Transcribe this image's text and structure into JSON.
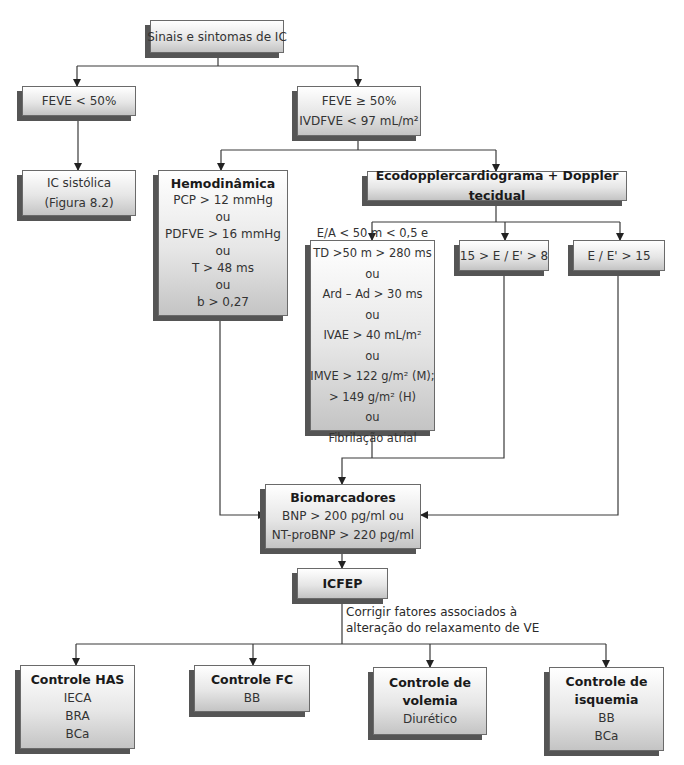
{
  "diagram": {
    "start": {
      "label": "Sinais e sintomas de IC"
    },
    "feve_low": {
      "label": "FEVE < 50%"
    },
    "feve_high": {
      "lines": [
        "FEVE ≥ 50%",
        "IVDFVE < 97 mL/m²"
      ]
    },
    "ic_sistolica": {
      "lines": [
        "IC sistólica",
        "(Figura 8.2)"
      ]
    },
    "hemodinamica": {
      "title": "Hemodinâmica",
      "lines": [
        "PCP > 12 mmHg",
        "ou",
        "PDFVE > 16 mmHg",
        "ou",
        "T > 48 ms",
        "ou",
        "b > 0,27"
      ]
    },
    "ecodoppler": {
      "title": "Ecodopplercardiograma + Doppler tecidual"
    },
    "eco_criteria": {
      "lines": [
        "E/A < 50 m < 0,5 e",
        "TD >50 m > 280 ms",
        "ou",
        "Ard – Ad > 30 ms",
        "ou",
        "IVAE > 40 mL/m²",
        "ou",
        "IMVE > 122 g/m² (M);",
        "> 149 g/m² (H)",
        "ou",
        "Fibrilação atrial"
      ]
    },
    "ratio_mid": {
      "label": "15 > E / E' > 8"
    },
    "ratio_high": {
      "label": "E / E' > 15"
    },
    "biomarcadores": {
      "title": "Biomarcadores",
      "lines": [
        "BNP > 200 pg/ml ou",
        "NT-proBNP > 220 pg/ml"
      ]
    },
    "icfep": {
      "title": "ICFEP"
    },
    "note": {
      "lines": [
        "Corrigir fatores associados à",
        "alteração do relaxamento de VE"
      ]
    },
    "controls": [
      {
        "title": "Controle HAS",
        "lines": [
          "IECA",
          "BRA",
          "BCa"
        ]
      },
      {
        "title": "Controle FC",
        "lines": [
          "BB"
        ]
      },
      {
        "title_lines": [
          "Controle de",
          "volemia"
        ],
        "lines": [
          "Diurético"
        ]
      },
      {
        "title_lines": [
          "Controle de",
          "isquemia"
        ],
        "lines": [
          "BB",
          "BCa"
        ]
      }
    ]
  },
  "colors": {
    "line": "#3a3a3a",
    "box_border": "#6a6a6a",
    "box_shadow": "#555555",
    "box_gradient_top": "#ffffff",
    "box_gradient_bottom": "#c4c4c4"
  }
}
